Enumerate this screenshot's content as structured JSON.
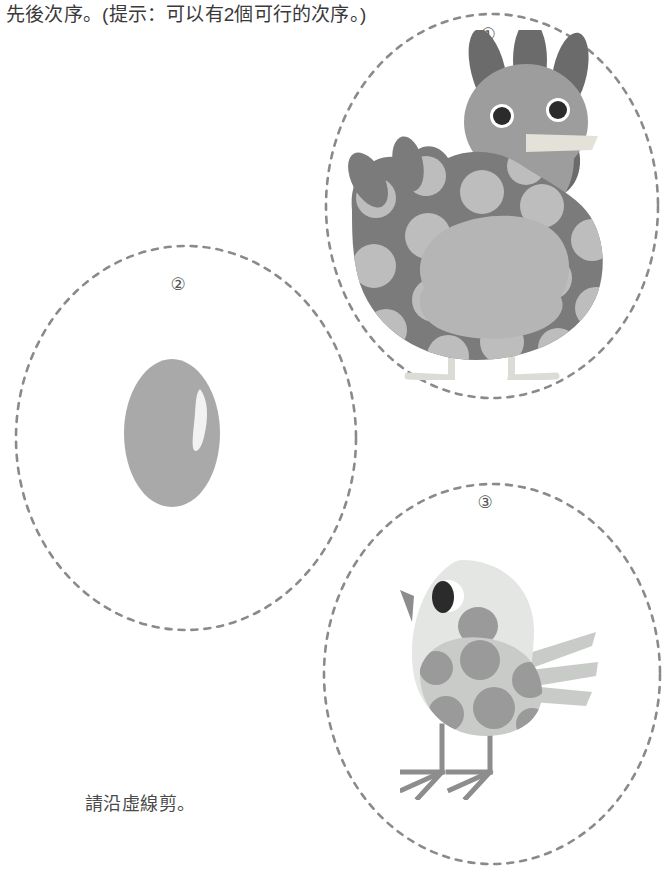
{
  "page": {
    "width": 666,
    "height": 875,
    "background": "#ffffff",
    "worksheet_type": "cut-and-sequence-activity"
  },
  "instructions": {
    "top_text": "先後次序。(提示：可以有2個可行的次序。)",
    "bottom_text": "請沿虛線剪。"
  },
  "colors": {
    "dashed_outline": "#8a8a8a",
    "text_dark": "#3a3a3a",
    "text_gray": "#4a4a4a",
    "number_gray": "#555555",
    "hen_comb": "#6b6b6b",
    "hen_head": "#9d9d9d",
    "hen_body": "#7b7b7b",
    "hen_spots": "#bdbdbd",
    "hen_wing": "#b5b5b5",
    "hen_beak": "#e3e1d8",
    "hen_legs": "#dcdcd6",
    "hen_eye": "#2b2b2b",
    "egg_shell": "#a9a9a9",
    "egg_highlight": "#f2f2f2",
    "chick_body": "#e4e6e4",
    "chick_wing": "#c9cbc9",
    "chick_spots": "#9a9a9a",
    "chick_beak": "#8d8d8d",
    "chick_eye": "#2b2b2b",
    "chick_eye_white": "#ffffff",
    "chick_legs": "#8d8d8d"
  },
  "cards": [
    {
      "number_label": "①",
      "figure": "hen",
      "figure_name": "hen-illustration",
      "alt": "spotted hen standing"
    },
    {
      "number_label": "②",
      "figure": "egg",
      "figure_name": "egg-illustration",
      "alt": "single egg with highlight"
    },
    {
      "number_label": "③",
      "figure": "chick",
      "figure_name": "chick-illustration",
      "alt": "small spotted chick standing"
    }
  ]
}
